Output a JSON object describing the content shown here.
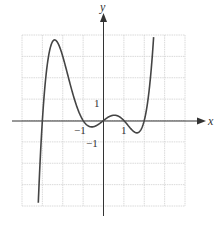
{
  "chart_data": {
    "type": "line",
    "title": "",
    "xlabel": "x",
    "ylabel": "y",
    "xlim": [
      -4,
      4
    ],
    "ylim": [
      -4,
      4
    ],
    "grid": true,
    "tick_labels": {
      "x": [
        {
          "value": -1,
          "label": "−1"
        },
        {
          "value": 1,
          "label": "1"
        }
      ],
      "y": [
        {
          "value": 1,
          "label": "1"
        },
        {
          "value": -1,
          "label": "−1"
        }
      ]
    },
    "series": [
      {
        "name": "f(x)",
        "description": "Quintic with roots at -3, -1, 0, 1, 2; local max near (-2.3, 3)",
        "x": [
          -3.3,
          -3.0,
          -2.5,
          -2.3,
          -2.0,
          -1.5,
          -1.0,
          -0.6,
          0.0,
          0.5,
          1.0,
          1.5,
          2.0,
          2.3,
          2.55
        ],
        "y": [
          -4.0,
          0.0,
          2.7,
          3.0,
          3.0,
          1.6,
          0.0,
          -0.3,
          0.0,
          0.25,
          0.0,
          -0.53,
          0.0,
          1.5,
          4.0
        ]
      }
    ]
  },
  "labels": {
    "x_axis": "x",
    "y_axis": "y",
    "x_neg1": "−1",
    "x_pos1": "1",
    "y_pos1": "1",
    "y_neg1": "−1"
  },
  "colors": {
    "curve": "#444444",
    "axis": "#333333",
    "grid": "#d0d0d0"
  }
}
